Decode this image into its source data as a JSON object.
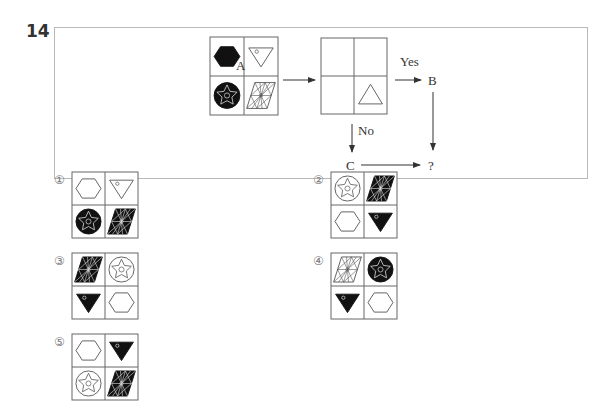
{
  "question": {
    "number": "14",
    "input_figure": {
      "cells": [
        {
          "position": "top-left",
          "shape": "hexagon",
          "style": "filled-black"
        },
        {
          "position": "top-right",
          "shape": "inverted-triangle-with-small-circle",
          "style": "outline"
        },
        {
          "position": "bottom-left",
          "shape": "star-in-circle",
          "style": "filled-black-circle"
        },
        {
          "position": "bottom-right",
          "shape": "patterned-parallelogram",
          "style": "outline"
        }
      ]
    },
    "arrow_a_label": "A",
    "test_figure": {
      "cells": [
        {
          "position": "top-left",
          "shape": "empty"
        },
        {
          "position": "top-right",
          "shape": "empty"
        },
        {
          "position": "bottom-left",
          "shape": "empty"
        },
        {
          "position": "bottom-right",
          "shape": "triangle",
          "style": "outline"
        }
      ]
    },
    "yes_label": "Yes",
    "no_label": "No",
    "b_label": "B",
    "c_label": "C",
    "result_label": "?"
  },
  "options": [
    {
      "label": "①",
      "cells": [
        {
          "shape": "hexagon",
          "style": "outline"
        },
        {
          "shape": "inverted-triangle",
          "style": "outline"
        },
        {
          "shape": "star-in-circle",
          "style": "filled"
        },
        {
          "shape": "parallelogram",
          "style": "filled"
        }
      ]
    },
    {
      "label": "②",
      "cells": [
        {
          "shape": "star-in-circle",
          "style": "outline"
        },
        {
          "shape": "parallelogram",
          "style": "filled"
        },
        {
          "shape": "hexagon",
          "style": "outline"
        },
        {
          "shape": "inverted-triangle",
          "style": "filled"
        }
      ]
    },
    {
      "label": "③",
      "cells": [
        {
          "shape": "parallelogram",
          "style": "filled"
        },
        {
          "shape": "star-in-circle",
          "style": "outline"
        },
        {
          "shape": "inverted-triangle",
          "style": "filled"
        },
        {
          "shape": "hexagon",
          "style": "outline"
        }
      ]
    },
    {
      "label": "④",
      "cells": [
        {
          "shape": "parallelogram",
          "style": "outline"
        },
        {
          "shape": "star-in-circle",
          "style": "filled"
        },
        {
          "shape": "inverted-triangle",
          "style": "filled"
        },
        {
          "shape": "hexagon",
          "style": "outline"
        }
      ]
    },
    {
      "label": "⑤",
      "cells": [
        {
          "shape": "hexagon",
          "style": "outline"
        },
        {
          "shape": "inverted-triangle",
          "style": "filled"
        },
        {
          "shape": "star-in-circle",
          "style": "outline"
        },
        {
          "shape": "parallelogram",
          "style": "filled"
        }
      ]
    }
  ]
}
